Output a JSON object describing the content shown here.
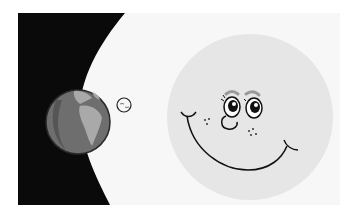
{
  "illustration": {
    "description": "Cartoon of Earth with its small moon in space and a large smiling moon face",
    "colors": {
      "page_background": "#ffffff",
      "panel_background": "#f7f7f7",
      "space_black": "#0a0a0a",
      "earth_ocean": "#6e6e6e",
      "earth_land": "#a9a9a9",
      "earth_shadow": "#555555",
      "earth_outline": "#2a2a2a",
      "moon_face_fill": "#e6e6e6",
      "line": "#111111",
      "brow": "#9a9a9a"
    },
    "elements": {
      "space": "space-region",
      "earth": "earth",
      "small_moon": "small-moon",
      "big_moon": "smiling-moon-face"
    }
  }
}
